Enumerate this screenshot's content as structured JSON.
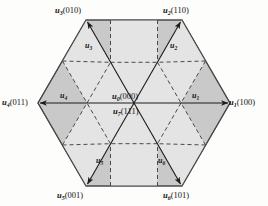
{
  "figure": {
    "type": "diagram",
    "colors": {
      "background": "#fdfdfb",
      "outer_region_fill": "#c9c9c9",
      "inner_region_fill": "#e4e4e4",
      "hexagon_stroke": "#4a4a4a",
      "dashed_stroke": "#4a4a4a",
      "arrow_stroke": "#1c1c1c",
      "text": "#141414"
    },
    "geometry": {
      "hex_center": [
        134,
        103
      ],
      "hex_radius": 96,
      "inner_radius": 47
    }
  },
  "vertex_labels": [
    {
      "id": "u3",
      "base": "u",
      "sub": "3",
      "code": "(010)",
      "text": "u3(010)",
      "x": 62,
      "y": 8,
      "align": "center"
    },
    {
      "id": "u2",
      "base": "u",
      "sub": "2",
      "code": "(110)",
      "text": "u2(110)",
      "x": 170,
      "y": 8,
      "align": "center"
    },
    {
      "id": "u4",
      "base": "u",
      "sub": "4",
      "code": "(011)",
      "text": "u4(011)",
      "x": 3,
      "y": 98,
      "align": "left"
    },
    {
      "id": "u1",
      "base": "u",
      "sub": "1",
      "code": "(100)",
      "text": "u1(100)",
      "x": 226,
      "y": 98,
      "align": "left"
    },
    {
      "id": "u5",
      "base": "u",
      "sub": "5",
      "code": "(001)",
      "text": "u5(001)",
      "x": 63,
      "y": 190,
      "align": "center"
    },
    {
      "id": "u6",
      "base": "u",
      "sub": "6",
      "code": "(101)",
      "text": "u6(101)",
      "x": 168,
      "y": 190,
      "align": "center"
    }
  ],
  "center_labels": [
    {
      "id": "u0",
      "base": "u",
      "sub": "0",
      "code": "(000)",
      "text": "u0(000)",
      "x": 112,
      "y": 93
    },
    {
      "id": "u7",
      "base": "u",
      "sub": "7",
      "code": "(111)",
      "text": "u7(111)",
      "x": 112,
      "y": 110
    }
  ],
  "vector_labels": [
    {
      "id": "u3v",
      "base": "u",
      "sub": "3",
      "x": 86,
      "y": 45
    },
    {
      "id": "u2v",
      "base": "u",
      "sub": "2",
      "x": 170,
      "y": 45
    },
    {
      "id": "u4v",
      "base": "u",
      "sub": "4",
      "x": 60,
      "y": 93
    },
    {
      "id": "u1v",
      "base": "u",
      "sub": "1",
      "x": 190,
      "y": 93
    },
    {
      "id": "u5v",
      "base": "u",
      "sub": "5",
      "x": 97,
      "y": 158
    },
    {
      "id": "u6v",
      "base": "u",
      "sub": "6",
      "x": 157,
      "y": 158
    }
  ],
  "arrows": [
    {
      "id": "arrow-u1",
      "from": [
        134,
        103
      ],
      "to": [
        228,
        103
      ],
      "label": "u1"
    },
    {
      "id": "arrow-u2",
      "from": [
        134,
        103
      ],
      "to": [
        181,
        21
      ],
      "label": "u2"
    },
    {
      "id": "arrow-u3",
      "from": [
        134,
        103
      ],
      "to": [
        87,
        21
      ],
      "label": "u3"
    },
    {
      "id": "arrow-u4",
      "from": [
        134,
        103
      ],
      "to": [
        40,
        103
      ],
      "label": "u4"
    },
    {
      "id": "arrow-u5",
      "from": [
        134,
        103
      ],
      "to": [
        87,
        185
      ],
      "label": "u5"
    },
    {
      "id": "arrow-u6",
      "from": [
        134,
        103
      ],
      "to": [
        181,
        185
      ],
      "label": "u6"
    }
  ]
}
